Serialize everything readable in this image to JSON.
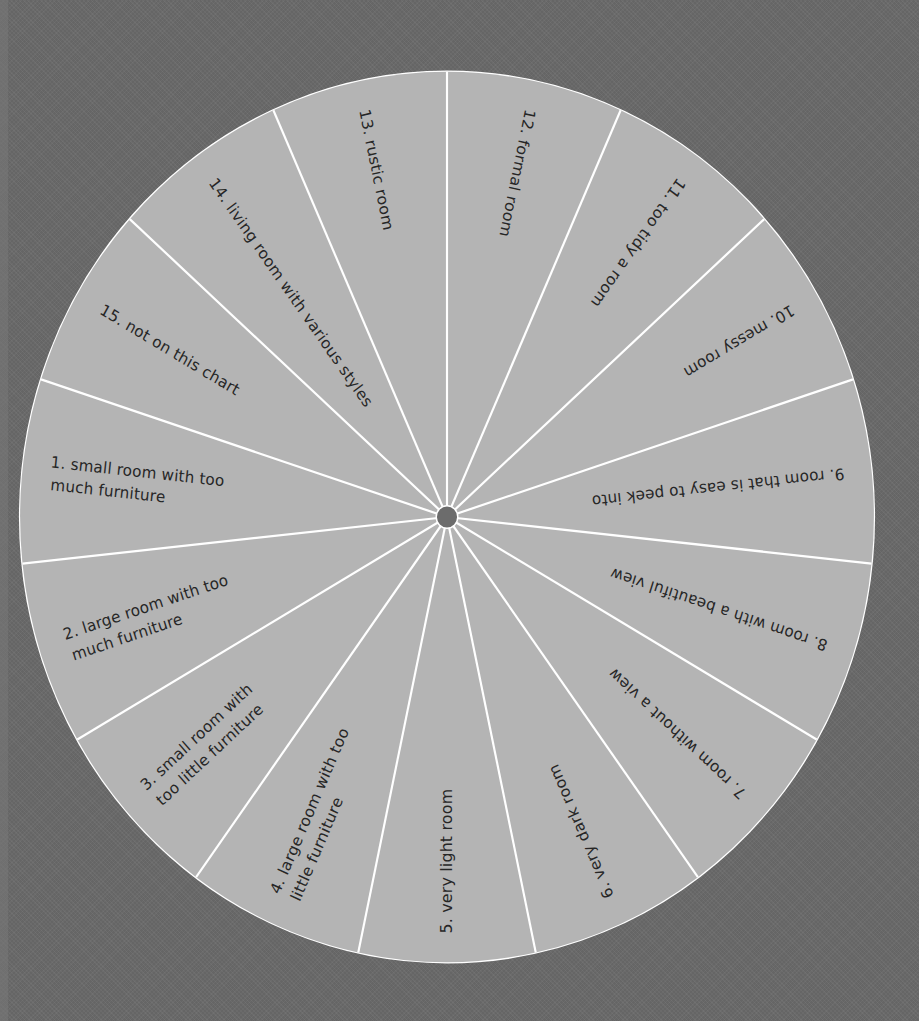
{
  "chart_data": {
    "type": "pie",
    "title": "",
    "layout": {
      "center": [
        447,
        517
      ],
      "radius_x": 427,
      "radius_y": 445,
      "hub_radius": 11,
      "segment_count": 15,
      "equal_segments": true,
      "first_spoke_angle_deg": -90
    },
    "categories": [
      "1. small room with too much furniture",
      "2. large room with too much furniture",
      "3. small room with too little furniture",
      "4. large room with too little furniture",
      "5. very light room",
      "6. very dark room",
      "7. room without a view",
      "8. room with a beautiful view",
      "9. room that is easy to peek into",
      "10. messy room",
      "11. too tidy a room",
      "12. formal room",
      "13. rustic room",
      "14. living room with various styles",
      "15. not on this chart"
    ],
    "values": [
      1,
      1,
      1,
      1,
      1,
      1,
      1,
      1,
      1,
      1,
      1,
      1,
      1,
      1,
      1
    ]
  },
  "colors": {
    "background": "#6b6b6b",
    "wheel_fill": "#b4b4b4",
    "spoke": "#ffffff",
    "rim": "#ffffff",
    "hub": "#6c6c6c",
    "text": "#262626"
  },
  "segments": [
    {
      "num": "12.",
      "lines": [
        "12.  formal room"
      ],
      "mid_deg": -78
    },
    {
      "num": "11.",
      "lines": [
        "11.  too tidy a room"
      ],
      "mid_deg": -54
    },
    {
      "num": "10.",
      "lines": [
        "10.  messy room"
      ],
      "mid_deg": -30
    },
    {
      "num": "9.",
      "lines": [
        "9.  room that is easy to peek into"
      ],
      "mid_deg": -6
    },
    {
      "num": "8.",
      "lines": [
        "8.  room with a beautiful view"
      ],
      "mid_deg": 18
    },
    {
      "num": "7.",
      "lines": [
        "7.  room without a view"
      ],
      "mid_deg": 42
    },
    {
      "num": "6.",
      "lines": [
        "6.  very dark room"
      ],
      "mid_deg": 66
    },
    {
      "num": "5.",
      "lines": [
        "5.  very light room"
      ],
      "mid_deg": 90
    },
    {
      "num": "4.",
      "lines": [
        "4.  large room with too",
        "little furniture"
      ],
      "mid_deg": 114
    },
    {
      "num": "3.",
      "lines": [
        "3.  small room with",
        "too little furniture"
      ],
      "mid_deg": 138
    },
    {
      "num": "2.",
      "lines": [
        "2.  large room with too",
        "much furniture"
      ],
      "mid_deg": 162
    },
    {
      "num": "1.",
      "lines": [
        "1.  small room with too",
        "much furniture"
      ],
      "mid_deg": 186
    },
    {
      "num": "15.",
      "lines": [
        "15.  not on this chart"
      ],
      "mid_deg": 210
    },
    {
      "num": "14.",
      "lines": [
        "14.  living room with various styles"
      ],
      "mid_deg": 234
    },
    {
      "num": "13.",
      "lines": [
        "13.  rustic room"
      ],
      "mid_deg": 258
    }
  ]
}
